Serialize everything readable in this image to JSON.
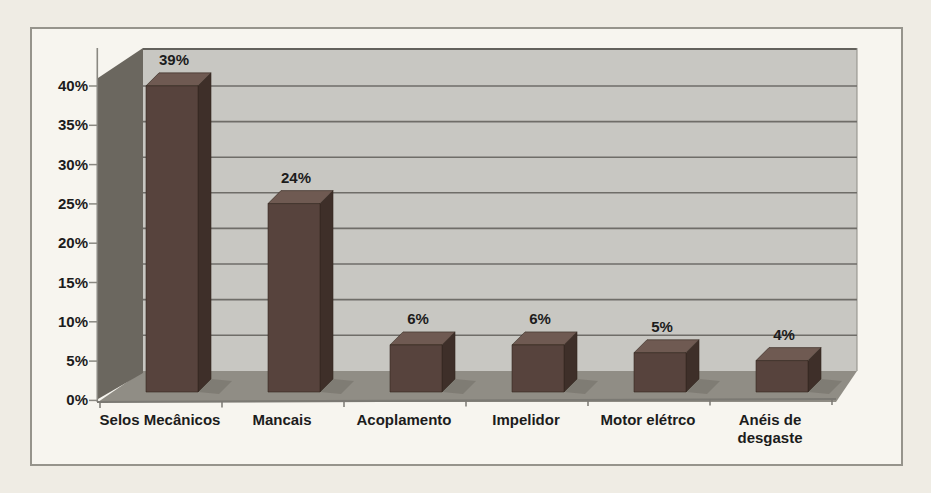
{
  "chart_data": {
    "type": "bar",
    "variant": "3d-column",
    "title": "",
    "xlabel": "",
    "ylabel": "",
    "categories": [
      "Selos Mecânicos",
      "Mancais",
      "Acoplamento",
      "Impelidor",
      "Motor elétrco",
      "Anéis de desgaste"
    ],
    "category_lines": [
      [
        "Selos Mecânicos"
      ],
      [
        "Mancais"
      ],
      [
        "Acoplamento"
      ],
      [
        "Impelidor"
      ],
      [
        "Motor elétrco"
      ],
      [
        "Anéis de",
        "desgaste"
      ]
    ],
    "values": [
      39,
      24,
      6,
      6,
      5,
      4
    ],
    "value_labels": [
      "39%",
      "24%",
      "6%",
      "6%",
      "5%",
      "4%"
    ],
    "yticks": [
      "40%",
      "35%",
      "30%",
      "25%",
      "20%",
      "15%",
      "10%",
      "5%",
      "0%"
    ],
    "ylim": [
      0,
      40
    ],
    "ytick_step": 5,
    "grid": "horizontal",
    "legend": "none",
    "colors": {
      "bar_front": "#57433d",
      "bar_top": "#6f5a52",
      "bar_side": "#3e2f29",
      "bar_edge": "#33261f",
      "back_wall": "#c8c7c2",
      "gridline": "#6f6d68",
      "wall_top_edge": "#63615c",
      "left_wall": "#6b675f",
      "floor": "#908d85",
      "axis": "#7b7973",
      "page_background": "#efece4",
      "chart_background": "#f7f5ef",
      "chart_border": "#96948c",
      "label_text": "#1c1c1c"
    }
  }
}
